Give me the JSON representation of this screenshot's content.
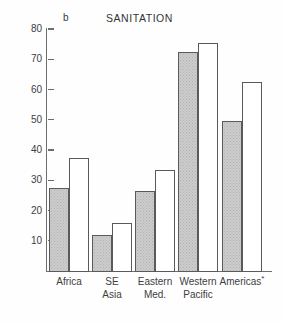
{
  "figure": {
    "panel_letter": "b",
    "title": "SANITATION"
  },
  "axis": {
    "tick_labels": [
      "80",
      "70",
      "60",
      "50",
      "40",
      "30",
      "20",
      "10"
    ]
  },
  "categories": [
    {
      "line1": "Africa",
      "line2": ""
    },
    {
      "line1": "SE",
      "line2": "Asia"
    },
    {
      "line1": "Eastern",
      "line2": "Med."
    },
    {
      "line1": "Western",
      "line2": "Pacific"
    },
    {
      "line1": "Americas",
      "line2": "",
      "note": "*"
    }
  ],
  "colors": {
    "shaded_fill": "#cccccc",
    "open_fill": "#ffffff",
    "bar_outline": "#5a5a5a",
    "axis": "#6d6d6d",
    "text": "#3d3d3d"
  },
  "chart_data": {
    "type": "bar",
    "title": "SANITATION",
    "panel": "b",
    "xlabel": "",
    "ylabel": "",
    "ylim": [
      0,
      80
    ],
    "yticks": [
      10,
      20,
      30,
      40,
      50,
      60,
      70,
      80
    ],
    "grid": false,
    "legend": null,
    "categories": [
      "Africa",
      "SE Asia",
      "Eastern Med.",
      "Western Pacific",
      "Americas*"
    ],
    "series": [
      {
        "name": "shaded",
        "values": [
          27.5,
          12.0,
          26.5,
          72.5,
          49.5
        ]
      },
      {
        "name": "open",
        "values": [
          37.5,
          16.0,
          33.5,
          75.5,
          62.5
        ]
      }
    ],
    "annotations": [
      "* asterisk on Americas category label"
    ]
  }
}
